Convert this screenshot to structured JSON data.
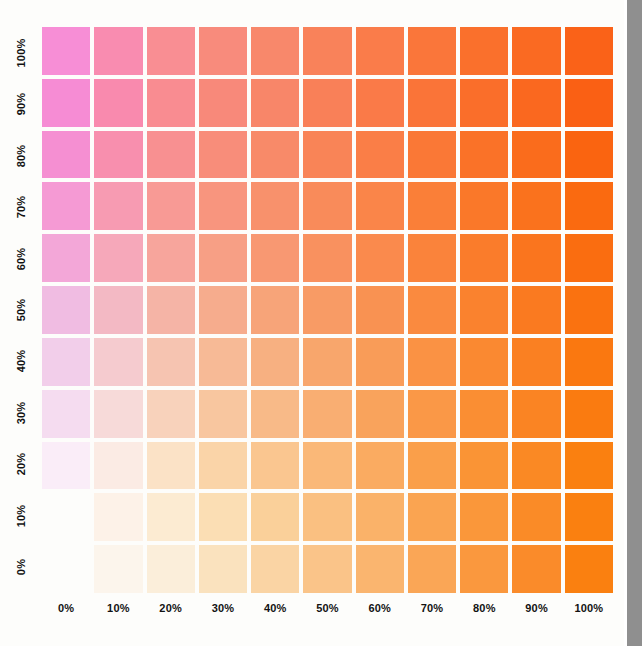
{
  "chart_data": {
    "type": "heatmap",
    "title": "",
    "xlabel": "",
    "ylabel": "",
    "grid": false,
    "legend": "none",
    "x_categories": [
      "0%",
      "10%",
      "20%",
      "30%",
      "40%",
      "50%",
      "60%",
      "70%",
      "80%",
      "90%",
      "100%"
    ],
    "y_categories": [
      "100%",
      "90%",
      "80%",
      "70%",
      "60%",
      "50%",
      "40%",
      "30%",
      "20%",
      "10%",
      "0%"
    ],
    "x_values": [
      0,
      10,
      20,
      30,
      40,
      50,
      60,
      70,
      80,
      90,
      100
    ],
    "y_values": [
      100,
      90,
      80,
      70,
      60,
      50,
      40,
      30,
      20,
      10,
      0
    ],
    "cell_colors": [
      [
        "#F78ED6",
        "#F98CB0",
        "#F98E93",
        "#F88B7C",
        "#F8886B",
        "#F9825A",
        "#FA7C4A",
        "#FA763A",
        "#FA702C",
        "#FA6A22",
        "#FA6218"
      ],
      [
        "#F68CD4",
        "#F98AAE",
        "#F98C91",
        "#F8897A",
        "#F88669",
        "#F98058",
        "#FA7A48",
        "#FA7438",
        "#FA6E2A",
        "#FA681F",
        "#FA6014"
      ],
      [
        "#F58FD2",
        "#F88FAE",
        "#F89091",
        "#F88D7A",
        "#F88A69",
        "#F98457",
        "#FA7E47",
        "#FA7836",
        "#FA7228",
        "#FA6C1C",
        "#FA6410"
      ],
      [
        "#F59AD4",
        "#F79BB2",
        "#F89A95",
        "#F8957E",
        "#F8916C",
        "#F98B5A",
        "#FA8549",
        "#FA7F38",
        "#FA7829",
        "#FA721D",
        "#FA6A10"
      ],
      [
        "#F3A7D8",
        "#F6A8BA",
        "#F7A59C",
        "#F79F85",
        "#F89872",
        "#F9915F",
        "#FA8A4D",
        "#FA833B",
        "#FA7C2B",
        "#FA751E",
        "#FA6D10"
      ],
      [
        "#F0BCE2",
        "#F3B9C4",
        "#F5B4A6",
        "#F6AC8D",
        "#F7A479",
        "#F89B65",
        "#F99252",
        "#FA8A3F",
        "#FA822E",
        "#FA7A20",
        "#FA7210"
      ],
      [
        "#F2CEEA",
        "#F5CBCF",
        "#F6C4B1",
        "#F7BA96",
        "#F7B081",
        "#F8A66C",
        "#F99C58",
        "#FA9244",
        "#FA8931",
        "#FA8022",
        "#FA7810"
      ],
      [
        "#F5DCF0",
        "#F7DAD9",
        "#F8D2BB",
        "#F8C69F",
        "#F8BA88",
        "#F9AE72",
        "#F9A35C",
        "#FA9847",
        "#FA8E33",
        "#FA8423",
        "#FA7B10"
      ],
      [
        "#FAEDF8",
        "#FBEBE4",
        "#FBE2C6",
        "#FAD4A8",
        "#FAC690",
        "#FAB878",
        "#FAAB61",
        "#FA9F4A",
        "#FA9435",
        "#FA8924",
        "#FA8010"
      ],
      [
        "#FFFFFF",
        "#FDF2E8",
        "#FCEBD2",
        "#FBDEB4",
        "#FAD09A",
        "#FAC081",
        "#FAB269",
        "#FAA451",
        "#FA973A",
        "#FA8B27",
        "#FA8010"
      ],
      [
        "#FFFFFF",
        "#FCF5EC",
        "#FBEEDA",
        "#FAE2BE",
        "#FAD4A4",
        "#FAC489",
        "#FAB56F",
        "#FAA656",
        "#FA983E",
        "#FA8B2A",
        "#FA8010"
      ]
    ]
  },
  "page": {
    "edge_color": "#8f8f8f",
    "background": "#fdfdfb",
    "label_color": "#121212"
  }
}
